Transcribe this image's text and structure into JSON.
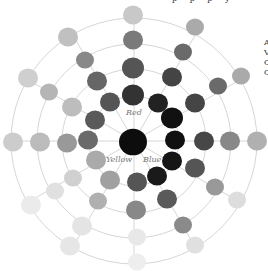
{
  "diagram": {
    "type": "color-wheel",
    "center": [
      134,
      141
    ],
    "ring_radii": [
      45,
      72,
      97,
      123
    ],
    "ring_color": "#cccccc",
    "spoke_color": "#cccccc",
    "labels": [
      {
        "text": "Red",
        "x": 126,
        "y": 116
      },
      {
        "text": "Yellow",
        "x": 106,
        "y": 163
      },
      {
        "text": "Blue",
        "x": 143,
        "y": 163
      }
    ],
    "blobs": [
      {
        "x": 133,
        "y": 142,
        "r": 14,
        "c": "#0d0d0d"
      },
      {
        "x": 133,
        "y": 95,
        "r": 11,
        "c": "#333333"
      },
      {
        "x": 133,
        "y": 68,
        "r": 11,
        "c": "#555555"
      },
      {
        "x": 133,
        "y": 40,
        "r": 10,
        "c": "#7a7a7a"
      },
      {
        "x": 133,
        "y": 15,
        "r": 10,
        "c": "#c8c8c8"
      },
      {
        "x": 158,
        "y": 103,
        "r": 10,
        "c": "#222222"
      },
      {
        "x": 172,
        "y": 118,
        "r": 11,
        "c": "#111111"
      },
      {
        "x": 175,
        "y": 140,
        "r": 10,
        "c": "#111111"
      },
      {
        "x": 172,
        "y": 161,
        "r": 10,
        "c": "#151515"
      },
      {
        "x": 157,
        "y": 176,
        "r": 10,
        "c": "#1a1a1a"
      },
      {
        "x": 172,
        "y": 77,
        "r": 10,
        "c": "#444444"
      },
      {
        "x": 195,
        "y": 103,
        "r": 10,
        "c": "#454545"
      },
      {
        "x": 204,
        "y": 141,
        "r": 10,
        "c": "#474747"
      },
      {
        "x": 195,
        "y": 168,
        "r": 10,
        "c": "#555555"
      },
      {
        "x": 167,
        "y": 199,
        "r": 10,
        "c": "#5a5a5a"
      },
      {
        "x": 183,
        "y": 52,
        "r": 9,
        "c": "#6a6a6a"
      },
      {
        "x": 218,
        "y": 86,
        "r": 9,
        "c": "#6a6a6a"
      },
      {
        "x": 230,
        "y": 141,
        "r": 10,
        "c": "#888888"
      },
      {
        "x": 215,
        "y": 187,
        "r": 9,
        "c": "#999999"
      },
      {
        "x": 183,
        "y": 225,
        "r": 9,
        "c": "#8a8a8a"
      },
      {
        "x": 195,
        "y": 27,
        "r": 9,
        "c": "#aaaaaa"
      },
      {
        "x": 241,
        "y": 76,
        "r": 9,
        "c": "#aaaaaa"
      },
      {
        "x": 257,
        "y": 141,
        "r": 10,
        "c": "#b0b0b0"
      },
      {
        "x": 237,
        "y": 200,
        "r": 9,
        "c": "#dddddd"
      },
      {
        "x": 195,
        "y": 245,
        "r": 9,
        "c": "#e0e0e0"
      },
      {
        "x": 137,
        "y": 182,
        "r": 10,
        "c": "#555555"
      },
      {
        "x": 136,
        "y": 210,
        "r": 10,
        "c": "#888888"
      },
      {
        "x": 137,
        "y": 237,
        "r": 9,
        "c": "#e8e8e8"
      },
      {
        "x": 137,
        "y": 262,
        "r": 9,
        "c": "#eeeeee"
      },
      {
        "x": 110,
        "y": 102,
        "r": 10,
        "c": "#555555"
      },
      {
        "x": 97,
        "y": 81,
        "r": 10,
        "c": "#666666"
      },
      {
        "x": 85,
        "y": 60,
        "r": 9,
        "c": "#888888"
      },
      {
        "x": 68,
        "y": 37,
        "r": 10,
        "c": "#c0c0c0"
      },
      {
        "x": 95,
        "y": 120,
        "r": 10,
        "c": "#5a5a5a"
      },
      {
        "x": 88,
        "y": 140,
        "r": 10,
        "c": "#6a6a6a"
      },
      {
        "x": 67,
        "y": 143,
        "r": 10,
        "c": "#999999"
      },
      {
        "x": 40,
        "y": 142,
        "r": 10,
        "c": "#bbbbbb"
      },
      {
        "x": 13,
        "y": 142,
        "r": 10,
        "c": "#cccccc"
      },
      {
        "x": 72,
        "y": 107,
        "r": 10,
        "c": "#bdbdbd"
      },
      {
        "x": 49,
        "y": 92,
        "r": 9,
        "c": "#b5b5b5"
      },
      {
        "x": 28,
        "y": 78,
        "r": 10,
        "c": "#cfcfcf"
      },
      {
        "x": 96,
        "y": 160,
        "r": 10,
        "c": "#aaaaaa"
      },
      {
        "x": 110,
        "y": 180,
        "r": 10,
        "c": "#a0a0a0"
      },
      {
        "x": 73,
        "y": 178,
        "r": 9,
        "c": "#d0d0d0"
      },
      {
        "x": 98,
        "y": 201,
        "r": 9,
        "c": "#b0b0b0"
      },
      {
        "x": 55,
        "y": 191,
        "r": 9,
        "c": "#e0e0e0"
      },
      {
        "x": 82,
        "y": 226,
        "r": 10,
        "c": "#e4e4e4"
      },
      {
        "x": 31,
        "y": 205,
        "r": 10,
        "c": "#ebebeb"
      },
      {
        "x": 70,
        "y": 246,
        "r": 10,
        "c": "#e6e6e6"
      }
    ]
  },
  "cropped_text": {
    "top": "p  p  p  y",
    "right_lines": [
      "A",
      "V",
      "C",
      "C"
    ]
  }
}
